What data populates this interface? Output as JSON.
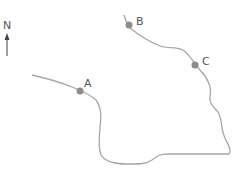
{
  "compass": {
    "label": "N"
  },
  "route": {
    "color": "#a6a6a6",
    "point_color": "#8c8c8c"
  },
  "points": [
    {
      "label": "A"
    },
    {
      "label": "B"
    },
    {
      "label": "C"
    }
  ]
}
